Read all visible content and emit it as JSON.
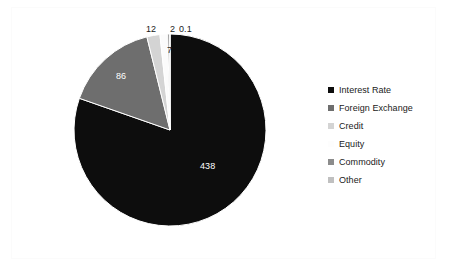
{
  "chart_data": {
    "type": "pie",
    "title": "",
    "categories": [
      "Interest Rate",
      "Foreign Exchange",
      "Credit",
      "Equity",
      "Commodity",
      "Other"
    ],
    "values": [
      438,
      86,
      12,
      7,
      2,
      0.1
    ],
    "value_labels": [
      "438",
      "86",
      "12",
      "7",
      "2",
      "0.1"
    ],
    "colors": [
      "#0d0d0d",
      "#6e6e6e",
      "#d4d4d4",
      "#fbfbfb",
      "#8c8c8c",
      "#c0c0c0"
    ],
    "legend_position": "right",
    "grid": false,
    "start_angle_deg": 0,
    "direction": "clockwise"
  },
  "legend": {
    "items": [
      {
        "label": "Interest Rate",
        "color": "#0d0d0d"
      },
      {
        "label": "Foreign Exchange",
        "color": "#6e6e6e"
      },
      {
        "label": "Credit",
        "color": "#d4d4d4"
      },
      {
        "label": "Equity",
        "color": "#fdfdfd"
      },
      {
        "label": "Commodity",
        "color": "#8c8c8c"
      },
      {
        "label": "Other",
        "color": "#c0c0c0"
      }
    ]
  },
  "labels": {
    "interest_rate": "438",
    "foreign_exchange": "86",
    "credit": "12",
    "equity": "7",
    "commodity": "2",
    "other": "0.1"
  }
}
